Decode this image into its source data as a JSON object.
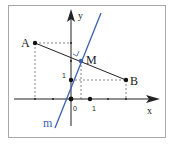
{
  "diagram": {
    "colors": {
      "frame": "#a8a8a8",
      "axis": "#222222",
      "segment": "#222222",
      "line_m": "#3a5fb0",
      "dashed": "#555555",
      "point": "#111111",
      "point_m": "#3a5fb0"
    },
    "axes": {
      "x_label": "x",
      "y_label": "y",
      "origin_label": "0",
      "x_unit_label": "1",
      "y_unit_label": "1"
    },
    "points": {
      "A": {
        "label": "A"
      },
      "B": {
        "label": "B"
      },
      "M": {
        "label": "M"
      }
    },
    "line": {
      "label": "m"
    }
  }
}
